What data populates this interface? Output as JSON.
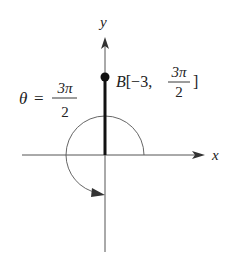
{
  "diagram": {
    "type": "polar-coordinate-plot",
    "axes": {
      "x_label": "x",
      "y_label": "y"
    },
    "point": {
      "name": "B",
      "r": "-3",
      "theta_num": "3π",
      "theta_den": "2",
      "label_prefix": "B[−3, ",
      "label_suffix": "]"
    },
    "angle": {
      "symbol": "θ",
      "equals": "=",
      "num": "3π",
      "den": "2"
    },
    "colors": {
      "ink": "#222222",
      "thin": "#555555",
      "background": "#ffffff"
    }
  }
}
